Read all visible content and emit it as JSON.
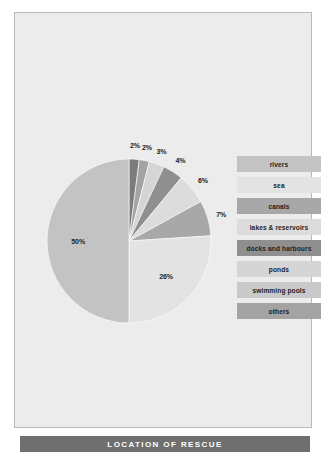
{
  "slide": {
    "background_color": "#ececec",
    "border_color": "#b9b9b9",
    "title_bar_color": "#6f6f6f",
    "title": "LOCATION OF RESCUE"
  },
  "chart_data": {
    "type": "pie",
    "title": "LOCATION OF RESCUE",
    "start_angle_deg": 0,
    "direction": "clockwise",
    "categories": [
      "rivers",
      "sea",
      "canals",
      "lakes & reservoirs",
      "docks and harbours",
      "ponds",
      "swimming pools",
      "others"
    ],
    "values": [
      50,
      26,
      7,
      6,
      4,
      3,
      2,
      2
    ],
    "unit": "%",
    "legend_position": "right",
    "grid": false,
    "slices": [
      {
        "label": "2%",
        "value": 2,
        "category": "swimming pools",
        "color": "#7c7c7c"
      },
      {
        "label": "2%",
        "value": 2,
        "category": "others",
        "color": "#a3a3a3"
      },
      {
        "label": "3%",
        "value": 3,
        "category": "ponds",
        "color": "#d5d5d5"
      },
      {
        "label": "4%",
        "value": 4,
        "category": "docks and harbours",
        "color": "#8f8f8f"
      },
      {
        "label": "6%",
        "value": 6,
        "category": "lakes & reservoirs",
        "color": "#dcdcdc"
      },
      {
        "label": "7%",
        "value": 7,
        "category": "canals",
        "color": "#a8a8a8"
      },
      {
        "label": "26%",
        "value": 26,
        "category": "sea",
        "color": "#e3e3e3"
      },
      {
        "label": "50%",
        "value": 50,
        "category": "rivers",
        "color": "#c3c3c3"
      }
    ]
  },
  "legend": {
    "items": [
      {
        "label": "rivers",
        "color": "#c3c3c3"
      },
      {
        "label": "sea",
        "color": "#e3e3e3"
      },
      {
        "label": "canals",
        "color": "#a8a8a8"
      },
      {
        "label": "lakes & reservoirs",
        "color": "#dcdcdc"
      },
      {
        "label": "docks and harbours",
        "color": "#8f8f8f"
      },
      {
        "label": "ponds",
        "color": "#d5d5d5"
      },
      {
        "label": "swimming pools",
        "color": "#c9c9c9"
      },
      {
        "label": "others",
        "color": "#a3a3a3"
      }
    ]
  }
}
